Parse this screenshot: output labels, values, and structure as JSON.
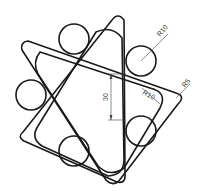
{
  "drawing": {
    "type": "technical-drawing",
    "description": "Overlapping rounded triangles with six tangent circles",
    "dimensions": {
      "circle_radius": "R10",
      "inner_fillet_radius": "R10",
      "tip_fillet_radius": "R5",
      "height": "30"
    },
    "colors": {
      "line": "#1a1a1a",
      "dimension": "#444444",
      "background": "#ffffff"
    }
  }
}
